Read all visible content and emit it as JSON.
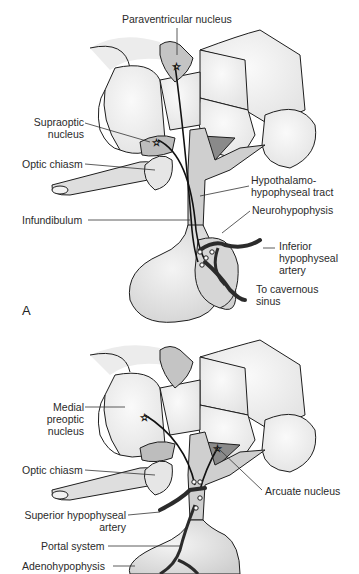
{
  "panel_a": {
    "letter": "A",
    "labels": {
      "paraventricular": "Paraventricular nucleus",
      "supraoptic_1": "Supraoptic",
      "supraoptic_2": "nucleus",
      "optic_chiasm": "Optic chiasm",
      "tract_1": "Hypothalamo-",
      "tract_2": "hypophyseal tract",
      "infundibulum": "Infundibulum",
      "neurohypophysis": "Neurohypophysis",
      "inferior_1": "Inferior",
      "inferior_2": "hypophyseal",
      "inferior_3": "artery",
      "sinus_1": "To cavernous",
      "sinus_2": "sinus"
    }
  },
  "panel_b": {
    "labels": {
      "medial_1": "Medial",
      "medial_2": "preoptic",
      "medial_3": "nucleus",
      "optic_chiasm": "Optic chiasm",
      "arcuate": "Arcuate nucleus",
      "superior_1": "Superior hypophyseal",
      "superior_2": "artery",
      "portal": "Portal system",
      "adeno": "Adenohypophysis"
    }
  },
  "colors": {
    "outline": "#1e1e1e",
    "light_fill": "#f2f2f2",
    "mid_fill": "#c8c8c8",
    "dark_fill": "#8a8a8a",
    "vessel": "#2b2b2b"
  }
}
